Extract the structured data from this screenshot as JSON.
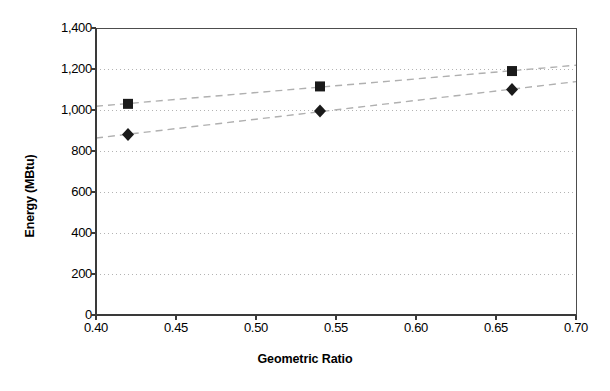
{
  "chart_data": {
    "type": "scatter",
    "title": "",
    "xlabel": "Geometric Ratio",
    "ylabel": "Energy (MBtu)",
    "xlim": [
      0.4,
      0.7
    ],
    "ylim": [
      0,
      1400
    ],
    "xticks": [
      "0.40",
      "0.45",
      "0.50",
      "0.55",
      "0.60",
      "0.65",
      "0.70"
    ],
    "xtick_values": [
      0.4,
      0.45,
      0.5,
      0.55,
      0.6,
      0.65,
      0.7
    ],
    "yticks": [
      "0",
      "200",
      "400",
      "600",
      "800",
      "1,000",
      "1,200",
      "1,400"
    ],
    "ytick_values": [
      0,
      200,
      400,
      600,
      800,
      1000,
      1200,
      1400
    ],
    "grid": "horizontal-dotted",
    "legend_position": "inline-annotations",
    "series": [
      {
        "name": "School",
        "marker": "square",
        "marker_color": "#1a1a1a",
        "trendline": true,
        "trendline_style": "dashed",
        "x": [
          0.42,
          0.54,
          0.66
        ],
        "values": [
          1030,
          1115,
          1190
        ],
        "label_x": 0.505,
        "label_y": 1140
      },
      {
        "name": "Office",
        "marker": "diamond",
        "marker_color": "#1a1a1a",
        "trendline": true,
        "trendline_style": "dashed",
        "x": [
          0.42,
          0.54,
          0.66
        ],
        "values": [
          880,
          995,
          1100
        ],
        "label_x": 0.552,
        "label_y": 905
      }
    ],
    "annotations": [
      {
        "text": "School",
        "x": 0.505,
        "y": 1140
      },
      {
        "text": "Office",
        "x": 0.552,
        "y": 905
      }
    ],
    "colors": {
      "axis": "#4d4d4d",
      "grid": "#b3b3b3",
      "marker": "#1a1a1a",
      "trendline": "#b0b0b0",
      "background": "#ffffff"
    }
  }
}
